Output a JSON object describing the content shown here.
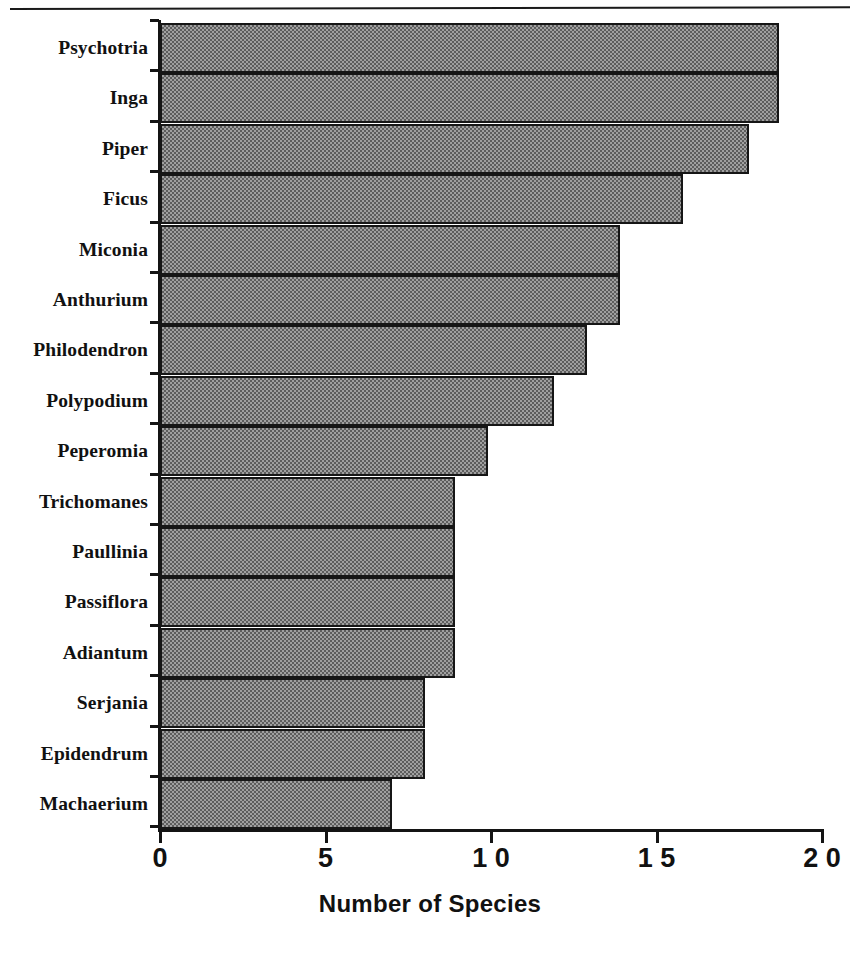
{
  "chart_data": {
    "type": "bar",
    "orientation": "horizontal",
    "title": "",
    "xlabel": "Number of Species",
    "ylabel": "",
    "xlim": [
      0,
      20
    ],
    "grid": false,
    "legend": null,
    "xticks": [
      0,
      5,
      10,
      15,
      20
    ],
    "xtick_labels": [
      "0",
      "5",
      "1 0",
      "1 5",
      "2 0"
    ],
    "categories": [
      "Psychotria",
      "Inga",
      "Piper",
      "Ficus",
      "Miconia",
      "Anthurium",
      "Philodendron",
      "Polypodium",
      "Peperomia",
      "Trichomanes",
      "Paullinia",
      "Passiflora",
      "Adiantum",
      "Serjania",
      "Epidendrum",
      "Machaerium"
    ],
    "values": [
      18.7,
      18.7,
      17.8,
      15.8,
      13.9,
      13.9,
      12.9,
      11.9,
      9.9,
      8.9,
      8.9,
      8.9,
      8.9,
      8.0,
      8.0,
      7.0
    ],
    "bar_fill_color": "#a0a0a0",
    "bar_edge_color": "#161616",
    "axis_color": "#141414",
    "background_color": "#ffffff"
  }
}
